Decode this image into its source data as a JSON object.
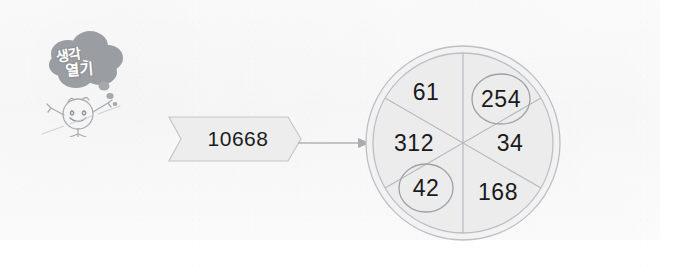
{
  "worksheet": {
    "mascot": {
      "bubble_line1": "생각",
      "bubble_line2": "열기",
      "icon": "thought-bubble-character"
    },
    "banner": {
      "value": "10668",
      "shape": "ribbon-chevron"
    },
    "arrow": {
      "icon": "arrow-right-icon",
      "direction": "right"
    },
    "wheel": {
      "segment_count": 6,
      "segments": [
        {
          "value": "61",
          "circled": false,
          "position": "top-left"
        },
        {
          "value": "254",
          "circled": true,
          "position": "top-right"
        },
        {
          "value": "34",
          "circled": false,
          "position": "right"
        },
        {
          "value": "168",
          "circled": false,
          "position": "bottom-right"
        },
        {
          "value": "42",
          "circled": true,
          "position": "bottom-left"
        },
        {
          "value": "312",
          "circled": false,
          "position": "left"
        }
      ]
    },
    "colors": {
      "ink": "#1a1a1a",
      "line": "#b9bcc0",
      "fill": "#eceded",
      "mascot": "#9a9da1",
      "page": "#ffffff"
    }
  }
}
